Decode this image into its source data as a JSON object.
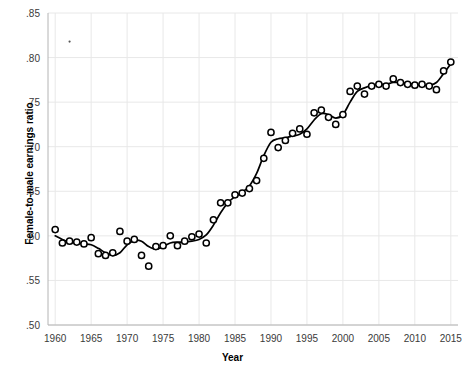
{
  "chart_data": {
    "type": "scatter",
    "title": "",
    "xlabel": "Year",
    "ylabel": "Female-to-male earnings ratio",
    "xlim": [
      1959,
      2016
    ],
    "ylim": [
      0.5,
      0.85
    ],
    "xticks": [
      1960,
      1965,
      1970,
      1975,
      1980,
      1985,
      1990,
      1995,
      2000,
      2005,
      2010,
      2015
    ],
    "xtick_labels": [
      "1960",
      "1965",
      "1970",
      "1975",
      "1980",
      "1985",
      "1990",
      "1995",
      "2000",
      "2005",
      "2010",
      "2015"
    ],
    "yticks": [
      0.5,
      0.55,
      0.6,
      0.65,
      0.7,
      0.75,
      0.8,
      0.85
    ],
    "ytick_labels": [
      ".50",
      ".55",
      ".60",
      ".65",
      ".70",
      ".75",
      ".80",
      ".85"
    ],
    "grid": true,
    "legend": "none",
    "marker": "open-circle",
    "marker_color": "#000000",
    "line_color": "#000000",
    "grid_color": "#e8e8e8",
    "axis_color": "#b4b4b4",
    "series": [
      {
        "name": "Female-to-male earnings ratio",
        "x": [
          1960,
          1961,
          1962,
          1963,
          1964,
          1965,
          1966,
          1967,
          1968,
          1969,
          1970,
          1971,
          1972,
          1973,
          1974,
          1975,
          1976,
          1977,
          1978,
          1979,
          1980,
          1981,
          1982,
          1983,
          1984,
          1985,
          1986,
          1987,
          1988,
          1989,
          1990,
          1991,
          1992,
          1993,
          1994,
          1995,
          1996,
          1997,
          1998,
          1999,
          2000,
          2001,
          2002,
          2003,
          2004,
          2005,
          2006,
          2007,
          2008,
          2009,
          2010,
          2011,
          2012,
          2013,
          2014,
          2015
        ],
        "values": [
          0.607,
          0.592,
          0.594,
          0.593,
          0.591,
          0.598,
          0.58,
          0.578,
          0.581,
          0.605,
          0.594,
          0.596,
          0.578,
          0.566,
          0.588,
          0.589,
          0.6,
          0.589,
          0.594,
          0.599,
          0.602,
          0.592,
          0.618,
          0.637,
          0.637,
          0.646,
          0.648,
          0.653,
          0.662,
          0.687,
          0.716,
          0.699,
          0.707,
          0.715,
          0.72,
          0.714,
          0.738,
          0.741,
          0.733,
          0.725,
          0.736,
          0.762,
          0.768,
          0.759,
          0.768,
          0.77,
          0.768,
          0.776,
          0.772,
          0.77,
          0.769,
          0.77,
          0.768,
          0.764,
          0.785,
          0.795
        ],
        "trend": [
          0.6,
          0.596,
          0.593,
          0.592,
          0.591,
          0.59,
          0.586,
          0.581,
          0.578,
          0.581,
          0.59,
          0.595,
          0.594,
          0.588,
          0.585,
          0.588,
          0.592,
          0.593,
          0.593,
          0.594,
          0.596,
          0.601,
          0.612,
          0.626,
          0.637,
          0.644,
          0.649,
          0.656,
          0.67,
          0.69,
          0.705,
          0.709,
          0.71,
          0.712,
          0.714,
          0.72,
          0.73,
          0.737,
          0.736,
          0.732,
          0.736,
          0.75,
          0.762,
          0.766,
          0.769,
          0.77,
          0.77,
          0.772,
          0.772,
          0.771,
          0.77,
          0.769,
          0.769,
          0.772,
          0.782,
          0.793
        ]
      }
    ],
    "stray_point": {
      "x": 1962,
      "y": 0.818
    }
  }
}
